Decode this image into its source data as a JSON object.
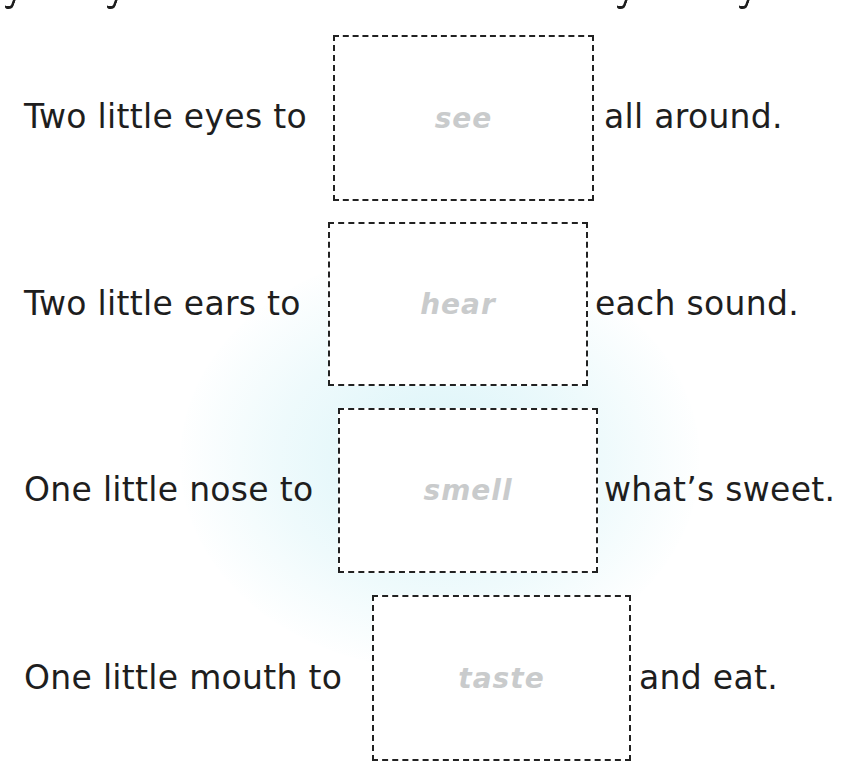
{
  "worksheet": {
    "lines": [
      {
        "before": "Two little eyes to",
        "answer": "see",
        "after": "all around."
      },
      {
        "before": "Two little ears to",
        "answer": "hear",
        "after": "each sound."
      },
      {
        "before": "One little nose to",
        "answer": "smell",
        "after": "what’s sweet."
      },
      {
        "before": "One little mouth to",
        "answer": "taste",
        "after": "and eat."
      }
    ]
  },
  "colors": {
    "text": "#1e1e1e",
    "answer_trace": "#c9cbcc",
    "box_border": "#222222",
    "background_glow": "#d7f3f8"
  }
}
